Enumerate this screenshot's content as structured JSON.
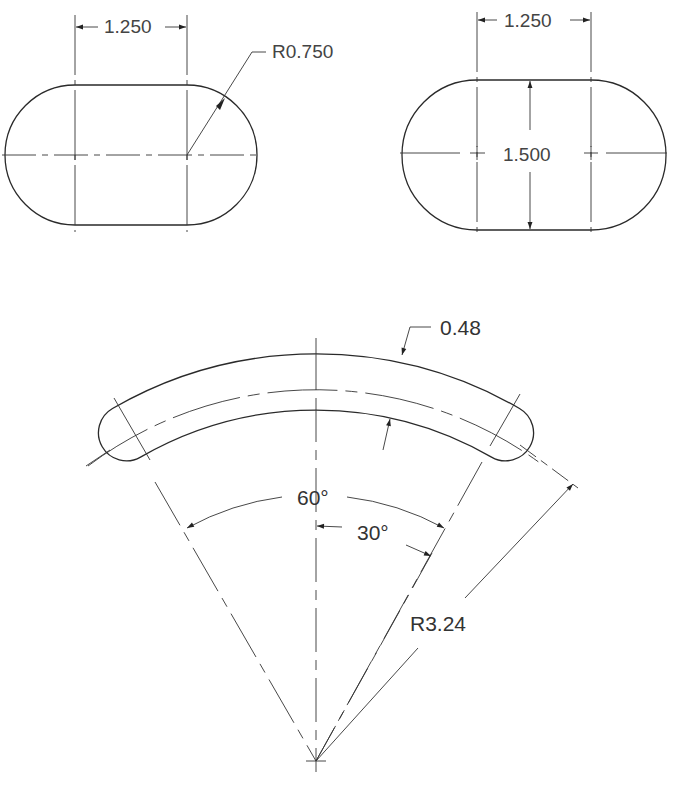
{
  "drawing": {
    "views": [
      {
        "name": "left-slot",
        "shape": "obround",
        "dimensions": {
          "center_distance": "1.250",
          "end_radius": "R0.750"
        }
      },
      {
        "name": "right-slot",
        "shape": "obround",
        "dimensions": {
          "center_distance": "1.250",
          "height": "1.500"
        }
      },
      {
        "name": "curved-slot",
        "shape": "arc-slot",
        "dimensions": {
          "slot_width": "0.48",
          "included_angle": "60°",
          "half_angle": "30°",
          "centerline_radius": "R3.24"
        }
      }
    ]
  }
}
